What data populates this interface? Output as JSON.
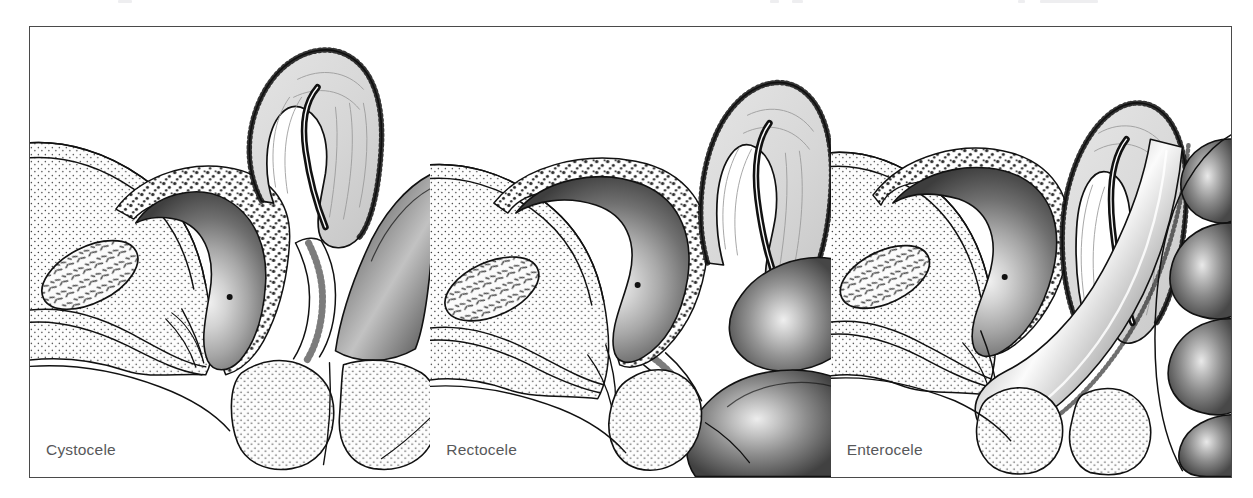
{
  "figure": {
    "domain": "medical-illustration",
    "title_visible": false,
    "border_color": "#4a4a4a",
    "background_color": "#ffffff",
    "caption_color": "#57585a",
    "panel_count": 3
  },
  "panels": [
    {
      "id": "cystocele",
      "caption": "Cystocele",
      "description": "Sagittal pelvic section: bladder herniating into the anterior vaginal wall",
      "structures": [
        "bladder",
        "uterus",
        "vagina",
        "rectum",
        "pubic-bone",
        "urethra",
        "soft-tissue"
      ]
    },
    {
      "id": "rectocele",
      "caption": "Rectocele",
      "description": "Sagittal pelvic section: rectum bulging into the posterior vaginal wall",
      "structures": [
        "bladder",
        "uterus",
        "vagina",
        "rectum",
        "pubic-bone",
        "urethra",
        "soft-tissue"
      ]
    },
    {
      "id": "enterocele",
      "caption": "Enterocele",
      "description": "Sagittal pelvic section: small bowel loops herniating into the vaginal vault",
      "structures": [
        "bladder",
        "uterus",
        "vagina",
        "rectum",
        "pubic-bone",
        "urethra",
        "small-bowel-loops",
        "soft-tissue"
      ]
    }
  ],
  "palette": {
    "ink": "#111111",
    "organ_dark": "#4a4a4a",
    "organ_mid": "#8d8d8d",
    "organ_light": "#c4c4c4",
    "organ_core": "#ececec",
    "uterus_fill": "#d8d8d8",
    "tissue_fill": "#fdfdfd",
    "stipple": "#3a3a3a"
  }
}
